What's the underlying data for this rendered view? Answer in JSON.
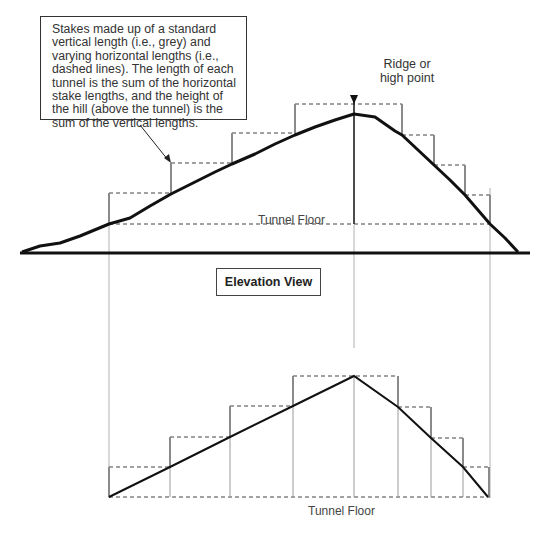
{
  "callout": {
    "text": "Stakes made up of a standard vertical length (i.e., grey) and varying horizontal lengths (i.e., dashed lines). The length of each tunnel is the sum of the horizontal stake lengths, and the height of the hill (above the tunnel) is the sum of the vertical lengths."
  },
  "ridge": {
    "label": "Ridge or high point"
  },
  "top_view": {
    "floor_label": "Tunnel Floor"
  },
  "section": {
    "label": "Elevation View"
  },
  "bottom_view": {
    "floor_label": "Tunnel Floor"
  },
  "colors": {
    "terrain": "#111111",
    "stake": "#8a8a8a",
    "dashed": "#444444",
    "guide": "#aaaaaa"
  }
}
